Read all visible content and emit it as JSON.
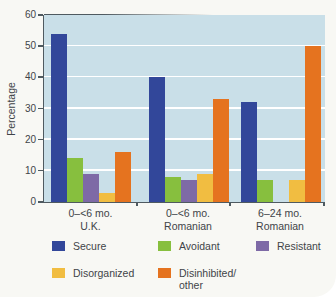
{
  "figure": {
    "background": "#f8f8f4",
    "plot_background": "#c9dfe8",
    "gridline_color": "#ffffff",
    "axis_color": "#4f5a60",
    "text_color": "#3f4448"
  },
  "chart_data": {
    "type": "bar",
    "title": "",
    "xlabel": "",
    "ylabel": "Percentage",
    "ylim": [
      0,
      60
    ],
    "yticks": [
      0,
      10,
      20,
      30,
      40,
      50,
      60
    ],
    "grid": true,
    "legend_position": "bottom",
    "categories": [
      "0–<6 mo. U.K.",
      "0–<6 mo. Romanian",
      "6–24 mo. Romanian"
    ],
    "series": [
      {
        "name": "Secure",
        "color": "#32479a",
        "values": [
          54,
          40,
          32
        ]
      },
      {
        "name": "Avoidant",
        "color": "#87bf3e",
        "values": [
          14,
          8,
          7
        ]
      },
      {
        "name": "Resistant",
        "color": "#7e6aa6",
        "values": [
          9,
          7,
          0
        ]
      },
      {
        "name": "Disorganized",
        "color": "#f1bd41",
        "values": [
          3,
          9,
          7
        ]
      },
      {
        "name": "Disinhibited/other",
        "color": "#e5731f",
        "values": [
          16,
          33,
          50
        ]
      }
    ]
  },
  "xaxis": {
    "groups": [
      {
        "line1": "0–<6 mo.",
        "line2": "U.K."
      },
      {
        "line1": "0–<6 mo.",
        "line2": "Romanian"
      },
      {
        "line1": "6–24 mo.",
        "line2": "Romanian"
      }
    ]
  },
  "legend": {
    "items": [
      {
        "label": "Secure",
        "line1": "Secure",
        "line2": "",
        "color": "#32479a"
      },
      {
        "label": "Avoidant",
        "line1": "Avoidant",
        "line2": "",
        "color": "#87bf3e"
      },
      {
        "label": "Resistant",
        "line1": "Resistant",
        "line2": "",
        "color": "#7e6aa6"
      },
      {
        "label": "Disorganized",
        "line1": "Disorganized",
        "line2": "",
        "color": "#f1bd41"
      },
      {
        "label": "Disinhibited/other",
        "line1": "Disinhibited/",
        "line2": "other",
        "color": "#e5731f"
      }
    ]
  }
}
